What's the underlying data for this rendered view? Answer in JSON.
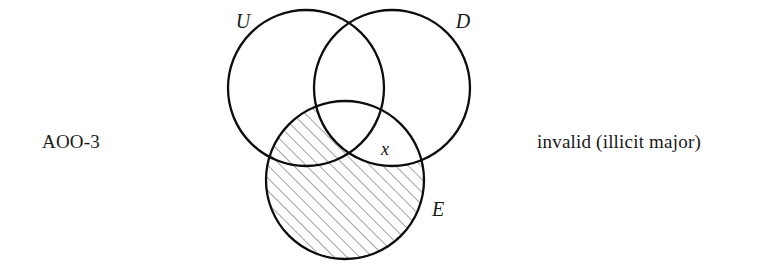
{
  "figure": {
    "type": "venn-diagram-three-circle",
    "left_label": "AOO-3",
    "right_label": "invalid (illicit major)",
    "background_color": "#ffffff",
    "stroke_color": "#0d0d0d",
    "hatch_color": "#555555",
    "circles": [
      {
        "id": "U",
        "label": "U",
        "cx": 306,
        "cy": 88,
        "r": 78,
        "label_x": 243,
        "label_y": 28
      },
      {
        "id": "D",
        "label": "D",
        "cx": 392,
        "cy": 88,
        "r": 78,
        "label_x": 463,
        "label_y": 28
      },
      {
        "id": "E",
        "label": "E",
        "cx": 345,
        "cy": 180,
        "r": 79,
        "label_x": 438,
        "label_y": 216
      }
    ],
    "marks": [
      {
        "id": "x-mark",
        "text": "x",
        "x": 385,
        "y": 155,
        "region": "D and E, not U"
      }
    ],
    "shaded_region": {
      "description": "E minus D",
      "pattern": "diagonal-hatch-45"
    }
  }
}
